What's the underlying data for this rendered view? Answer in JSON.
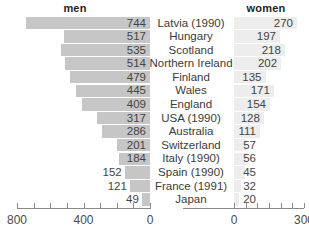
{
  "header": {
    "men_label": "men",
    "women_label": "women"
  },
  "chart_data": {
    "type": "bar",
    "title": "",
    "subtitle": "",
    "orientation": "horizontal-diverging",
    "xlabel": "",
    "ylabel": "",
    "grid": false,
    "legend_position": "top",
    "categories": [
      "Latvia (1990)",
      "Hungary",
      "Scotland",
      "Northern Ireland",
      "Finland",
      "Wales",
      "England",
      "USA (1990)",
      "Australia",
      "Switzerland",
      "Italy (1990)",
      "Spain (1990)",
      "France (1991)",
      "Japan"
    ],
    "series": [
      {
        "name": "men",
        "direction": "left",
        "axis_range": [
          0,
          800
        ],
        "axis_ticks": [
          800,
          700,
          600,
          500,
          400,
          300,
          200,
          100,
          0
        ],
        "axis_tick_labels": [
          "800",
          "",
          "",
          "",
          "400",
          "",
          "",
          "",
          "0"
        ],
        "color": "#c6c6c6",
        "values": [
          744,
          517,
          535,
          514,
          479,
          445,
          409,
          317,
          286,
          201,
          184,
          152,
          121,
          49
        ]
      },
      {
        "name": "women",
        "direction": "right",
        "axis_range": [
          0,
          300
        ],
        "axis_ticks": [
          0,
          50,
          100,
          150,
          200,
          250,
          300
        ],
        "axis_tick_labels": [
          "0",
          "",
          "",
          "",
          "",
          "",
          "300"
        ],
        "color": "#ededed",
        "values": [
          270,
          197,
          218,
          202,
          135,
          171,
          154,
          128,
          111,
          57,
          56,
          45,
          32,
          20
        ]
      }
    ]
  },
  "axes": {
    "left": {
      "labels": [
        "800",
        "400",
        "0"
      ],
      "label_values": [
        800,
        400,
        0
      ]
    },
    "right": {
      "labels": [
        "0",
        "300"
      ],
      "label_values": [
        0,
        300
      ]
    }
  },
  "colors": {
    "men_bar": "#c6c6c6",
    "women_bar": "#ededed",
    "axis": "#8a8a8a",
    "text": "#3b3b3b",
    "background": "#ffffff"
  }
}
